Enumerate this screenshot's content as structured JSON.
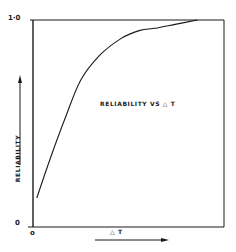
{
  "chart_data": {
    "type": "line",
    "title": "RELIABILITY VS △ T",
    "xlabel": "△ T",
    "ylabel": "RELIABILITY",
    "x_ticks": [
      "0"
    ],
    "y_ticks": [
      "0",
      "1·0"
    ],
    "xlim": [
      0,
      1
    ],
    "ylim": [
      0,
      1.0
    ],
    "grid": false,
    "legend": null,
    "series": [
      {
        "name": "Reliability",
        "x": [
          0.02,
          0.09,
          0.17,
          0.25,
          0.35,
          0.46,
          0.56,
          0.64,
          0.75,
          0.86
        ],
        "y": [
          0.14,
          0.33,
          0.53,
          0.71,
          0.83,
          0.91,
          0.95,
          0.96,
          0.98,
          1.0
        ]
      }
    ],
    "annotations": [
      "RELIABILITY VS △ T"
    ],
    "axis_arrows": {
      "x": "right",
      "y": "up"
    }
  },
  "labels": {
    "title": "RELIABILITY VS △ T",
    "xlabel": "△ T",
    "ylabel": "RELIABILITY",
    "ytick_top": "1·0",
    "ytick_bottom": "0",
    "xtick_origin": "o"
  },
  "colors": {
    "ink": "#1a1a1a",
    "background": "#ffffff"
  }
}
